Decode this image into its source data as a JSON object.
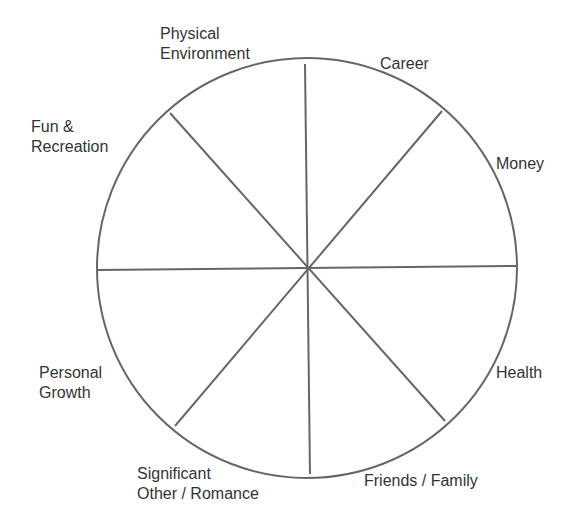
{
  "diagram": {
    "type": "wheel-of-life",
    "colors": {
      "stroke": "#666666",
      "text": "#333333",
      "background": "#ffffff"
    },
    "circle": {
      "cx": 307,
      "cy": 268,
      "r": 210
    },
    "spokes": [
      {
        "x1": 305,
        "y1": 64,
        "x2": 310,
        "y2": 474
      },
      {
        "x1": 97,
        "y1": 270,
        "x2": 517,
        "y2": 266
      },
      {
        "x1": 170,
        "y1": 113,
        "x2": 445,
        "y2": 421
      },
      {
        "x1": 442,
        "y1": 111,
        "x2": 175,
        "y2": 426
      }
    ],
    "segments": [
      {
        "name": "career",
        "lines": [
          "Career"
        ]
      },
      {
        "name": "money",
        "lines": [
          "Money"
        ]
      },
      {
        "name": "health",
        "lines": [
          "Health"
        ]
      },
      {
        "name": "friends-family",
        "lines": [
          "Friends / Family"
        ]
      },
      {
        "name": "significant-other",
        "lines": [
          "Significant",
          "Other / Romance"
        ]
      },
      {
        "name": "personal-growth",
        "lines": [
          "Personal",
          "Growth"
        ]
      },
      {
        "name": "fun-recreation",
        "lines": [
          "Fun &",
          "Recreation"
        ]
      },
      {
        "name": "physical-environment",
        "lines": [
          "Physical",
          "Environment"
        ]
      }
    ]
  }
}
